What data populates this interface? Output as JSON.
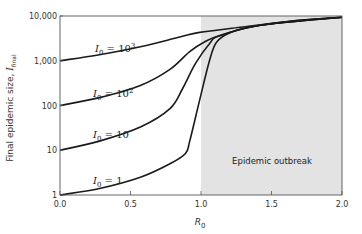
{
  "chart_data": {
    "type": "line",
    "title": "",
    "xlabel": "R0",
    "ylabel": "Final epidemic size, I_final",
    "xlim": [
      0.0,
      2.0
    ],
    "ylim": [
      1,
      10000
    ],
    "yscale": "log",
    "grid": false,
    "x_ticks": [
      "0.0",
      "0.5",
      "1.0",
      "1.5",
      "2.0"
    ],
    "y_ticks": [
      "1",
      "10",
      "100",
      "1,000",
      "10,000"
    ],
    "shaded_region": {
      "x_from": 1.0,
      "x_to": 2.0,
      "label": "Epidemic outbreak",
      "color": "#e3e3e3"
    },
    "series": [
      {
        "name": "I0 = 1",
        "label_main": "I",
        "label_sub": "0",
        "label_rest": " = 1",
        "label_sup": "",
        "x": [
          0.0,
          0.28,
          0.57,
          0.78,
          0.89,
          0.92,
          0.99,
          1.06,
          1.11,
          1.21,
          1.42,
          1.7,
          2.0
        ],
        "y": [
          1,
          1.4,
          2.5,
          5,
          8.5,
          16,
          130,
          1000,
          2600,
          4300,
          6200,
          8000,
          9400
        ]
      },
      {
        "name": "I0 = 10",
        "label_main": "I",
        "label_sub": "0",
        "label_rest": " = 10",
        "label_sup": "",
        "x": [
          0.0,
          0.28,
          0.57,
          0.78,
          0.87,
          0.96,
          1.06,
          1.13,
          1.42,
          2.0
        ],
        "y": [
          10,
          16,
          33,
          85,
          240,
          860,
          2400,
          3600,
          6200,
          9400
        ]
      },
      {
        "name": "I0 = 10^2",
        "label_main": "I",
        "label_sub": "0",
        "label_rest": " = 10",
        "label_sup": "2",
        "x": [
          0.0,
          0.28,
          0.57,
          0.78,
          0.92,
          1.03,
          1.13,
          1.42,
          2.0
        ],
        "y": [
          100,
          150,
          280,
          640,
          1600,
          2700,
          3600,
          6200,
          9400
        ]
      },
      {
        "name": "I0 = 10^3",
        "label_main": "I",
        "label_sub": "0",
        "label_rest": " = 10",
        "label_sup": "3",
        "x": [
          0.0,
          0.28,
          0.57,
          0.85,
          0.99,
          1.28,
          1.7,
          2.0
        ],
        "y": [
          1000,
          1360,
          2050,
          3400,
          4300,
          5600,
          8000,
          9400
        ]
      }
    ]
  },
  "annotations": {
    "region_label": "Epidemic outbreak"
  },
  "axes": {
    "x_title_main": "R",
    "x_title_sub": "0",
    "y_title_main": "Final epidemic size, ",
    "y_title_var": "I",
    "y_title_sub": "final"
  }
}
